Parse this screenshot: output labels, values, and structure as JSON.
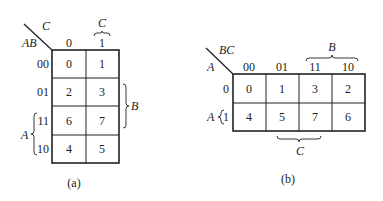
{
  "map_a": {
    "caption": "(a)",
    "row_var": "AB",
    "col_var": "C",
    "col_headers": [
      "0",
      "1"
    ],
    "row_headers": [
      "00",
      "01",
      "11",
      "10"
    ],
    "cells": [
      [
        "0",
        "1"
      ],
      [
        "2",
        "3"
      ],
      [
        "6",
        "7"
      ],
      [
        "4",
        "5"
      ]
    ],
    "brace_top_label": "C",
    "brace_right_label": "B",
    "brace_left_label": "A"
  },
  "map_b": {
    "caption": "(b)",
    "row_var": "A",
    "col_var": "BC",
    "col_headers": [
      "00",
      "01",
      "11",
      "10"
    ],
    "row_headers": [
      "0",
      "1"
    ],
    "cells": [
      [
        "0",
        "1",
        "3",
        "2"
      ],
      [
        "4",
        "5",
        "7",
        "6"
      ]
    ],
    "brace_top_label": "B",
    "brace_bottom_label": "C",
    "brace_left_label": "A"
  }
}
